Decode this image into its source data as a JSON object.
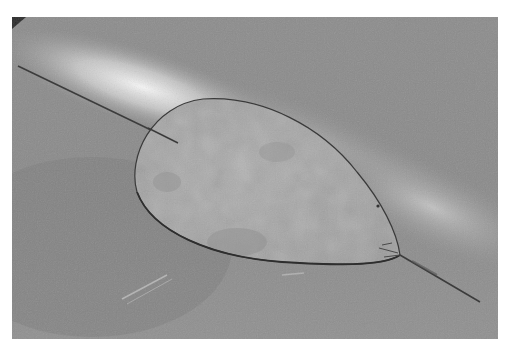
{
  "image": {
    "description": "Grayscale photograph of a teardrop-shaped flat plate pierced by a thin rod, lying on a reflective metal surface with a diagonal band of light",
    "subject": "teardrop-shaped plate",
    "rod": "thin rod passing through the plate",
    "background": "reflective metal surface",
    "colors": {
      "border": "#ffffff",
      "surface_dark": "#7e7e7e",
      "surface_mid": "#9a9a9a",
      "highlight": "#f2f2f2",
      "plate": "#a6a6a6",
      "plate_edge": "#3a3a3a",
      "rod": "#3c3c3c"
    }
  }
}
